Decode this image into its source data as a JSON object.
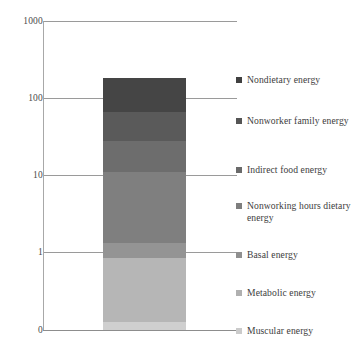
{
  "chart_data": {
    "type": "bar",
    "subtype": "stacked-bar-single-category",
    "title": "",
    "xlabel": "",
    "ylabel": "",
    "categories": [
      "Total energy"
    ],
    "yscale": "log",
    "ylim": [
      0,
      1000
    ],
    "ytick_labels": [
      "1000",
      "100",
      "10",
      "1",
      "0"
    ],
    "ytick_values": [
      1000,
      100,
      10,
      1,
      0
    ],
    "grid": true,
    "legend_position": "right",
    "stack_order_top_to_bottom": [
      "Nondietary energy",
      "Nonworker family energy",
      "Indirect food energy",
      "Nonworking hours dietary energy",
      "Basal energy",
      "Metabolic energy",
      "Muscular energy"
    ],
    "series": [
      {
        "name": "Muscular energy",
        "value": 0.07,
        "color": "#cccccc"
      },
      {
        "name": "Metabolic energy",
        "value": 0.65,
        "color": "#bdbdbd"
      },
      {
        "name": "Basal energy",
        "value": 0.58,
        "color": "#a8a8a8"
      },
      {
        "name": "Nonworking hours dietary energy",
        "value": 9.7,
        "color": "#8a8a8a"
      },
      {
        "name": "Indirect food energy",
        "value": 59.0,
        "color": "#6f6f6f"
      },
      {
        "name": "Nonworker family energy",
        "value": 40.0,
        "color": "#5e5e5e"
      },
      {
        "name": "Nondietary energy",
        "value": 70.0,
        "color": "#454545"
      }
    ],
    "cumulative_top_to_bottom": [
      180,
      110,
      51,
      11.5,
      1.35,
      0.72,
      0.07
    ],
    "bar_total": 180
  },
  "axis": {
    "ticks": [
      {
        "label": "1000",
        "y": 21
      },
      {
        "label": "100",
        "y": 98
      },
      {
        "label": "10",
        "y": 175
      },
      {
        "label": "1",
        "y": 252
      },
      {
        "label": "0",
        "y": 330
      }
    ]
  },
  "bar": {
    "segments": [
      {
        "name": "Nondietary energy",
        "top": 78,
        "bottom": 112,
        "color": "#454545"
      },
      {
        "name": "Nonworker family energy",
        "top": 112,
        "bottom": 141,
        "color": "#5a5a5a"
      },
      {
        "name": "Indirect food energy",
        "top": 141,
        "bottom": 172,
        "color": "#6d6d6d"
      },
      {
        "name": "Nonworking hours dietary energy",
        "top": 172,
        "bottom": 243,
        "color": "#7f7f7f"
      },
      {
        "name": "Basal energy",
        "top": 243,
        "bottom": 258,
        "color": "#949494"
      },
      {
        "name": "Metabolic energy",
        "top": 258,
        "bottom": 322,
        "color": "#b6b6b6"
      },
      {
        "name": "Muscular energy",
        "top": 322,
        "bottom": 330,
        "color": "#cfcfcf"
      }
    ]
  },
  "legend": {
    "items": [
      {
        "label": "Nondietary energy",
        "color": "#404040",
        "top": 0,
        "lines": 1
      },
      {
        "label": "Nonworker family energy",
        "color": "#555555",
        "top": 41,
        "lines": 2
      },
      {
        "label": "Indirect food energy",
        "color": "#6a6a6a",
        "top": 90,
        "lines": 1
      },
      {
        "label": "Nonworking hours dietary energy",
        "color": "#7e7e7e",
        "top": 126,
        "lines": 2
      },
      {
        "label": "Basal energy",
        "color": "#909090",
        "top": 175,
        "lines": 1
      },
      {
        "label": "Metabolic energy",
        "color": "#b0b0b0",
        "top": 213,
        "lines": 1
      },
      {
        "label": "Muscular energy",
        "color": "#cbcbcb",
        "top": 251,
        "lines": 1
      }
    ]
  }
}
